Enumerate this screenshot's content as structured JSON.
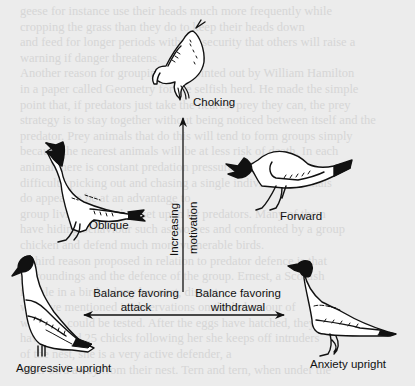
{
  "diagram": {
    "title": "",
    "postures": [
      {
        "id": "choking",
        "label": "Choking"
      },
      {
        "id": "oblique",
        "label": "Oblique"
      },
      {
        "id": "forward",
        "label": "Forward"
      },
      {
        "id": "aggressive-upright",
        "label": "Aggressive upright"
      },
      {
        "id": "anxiety-upright",
        "label": "Anxiety upright"
      }
    ],
    "vertical_axis": {
      "line1": "Increasing",
      "line2": "motivation"
    },
    "horizontal_axis": {
      "left_line1": "Balance favoring",
      "left_line2": "attack",
      "right_line1": "Balance favoring",
      "right_line2": "withdrawal"
    }
  },
  "background_text": {
    "lines": [
      "geese for instance use their heads much more frequently while",
      "cropping the grass than they do to keep their heads down",
      "and feed for longer periods with the security that others will raise a",
      "warning if danger threatens.",
      "Another reason for grouping was pointed out by William Hamilton",
      "in a paper called Geometry for the selfish herd. He made the simple",
      "point that, if predators just take the nearest prey they can, the prey",
      "strategy is to stay together without being noticed between itself and the",
      "predator. Prey animals that do this will tend to form groups simply",
      "because the nearest animals will be at less risk of death. In each",
      "animal there is constant predation pressure. It has",
      "difficulty picking out and chasing a single individual. Animals",
      "do appear to be at an advantage to",
      "group living even when set upon by predators. Many of them",
      "have hiding behaviour such as wolves and confronted by a group",
      "chicken and defend much more vulnerable birds.",
      "A third reason proposed in relation to predator defence is that",
      "surroundings and the defence of the group. Ernest, a Scottish",
      "female in a bird colony her nest, distant",
      "we have mentioned is observations on the behaviour of",
      "was then could be tested. After the eggs have hatched, they",
      "have around 25 chicks following her she keeps off intruders",
      "of the nest, she is a very active defender, a",
      "other bird away from their nest. Tern and tern, when under the"
    ]
  }
}
